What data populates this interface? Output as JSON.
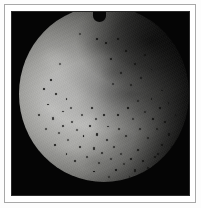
{
  "figure": {
    "kind": "endoscopic-photograph",
    "width_px": 201,
    "height_px": 208,
    "frame": {
      "page_background": "#fdfdfd",
      "rule_color": "#a8a8a8",
      "mat_color": "#ffffff",
      "panel_color": "#050505"
    },
    "image": {
      "modality": "endoscopy",
      "field_of_view": "circular",
      "illumination_center": "left-of-centre",
      "highlight_color": "#d2d2d0",
      "midtone_color": "#9a9a97",
      "shadow_color": "#1d1d1c",
      "background_color": "#050505",
      "features": [
        "bright mucosal surface filling lower-left two thirds",
        "dark shadowed fold sweeping from upper right toward centre",
        "numerous small dark petechial spots concentrated in lower half",
        "notch at top of circular field"
      ]
    },
    "spots": [
      {
        "x": 36.0,
        "y": 16.0,
        "r": 1.1
      },
      {
        "x": 46.0,
        "y": 18.5,
        "r": 1.0
      },
      {
        "x": 51.0,
        "y": 21.0,
        "r": 0.9
      },
      {
        "x": 58.5,
        "y": 19.0,
        "r": 1.0
      },
      {
        "x": 63.0,
        "y": 25.5,
        "r": 0.9
      },
      {
        "x": 54.0,
        "y": 30.0,
        "r": 0.8
      },
      {
        "x": 68.0,
        "y": 33.0,
        "r": 1.0
      },
      {
        "x": 74.0,
        "y": 28.0,
        "r": 0.9
      },
      {
        "x": 60.0,
        "y": 38.0,
        "r": 1.2
      },
      {
        "x": 72.0,
        "y": 41.0,
        "r": 1.0
      },
      {
        "x": 66.0,
        "y": 45.0,
        "r": 0.9
      },
      {
        "x": 78.0,
        "y": 36.0,
        "r": 0.8
      },
      {
        "x": 55.5,
        "y": 44.5,
        "r": 1.0
      },
      {
        "x": 24.0,
        "y": 33.0,
        "r": 0.9
      },
      {
        "x": 19.0,
        "y": 42.0,
        "r": 1.0
      },
      {
        "x": 14.5,
        "y": 47.0,
        "r": 0.9
      },
      {
        "x": 22.0,
        "y": 50.0,
        "r": 1.1
      },
      {
        "x": 17.0,
        "y": 56.0,
        "r": 0.9
      },
      {
        "x": 28.0,
        "y": 53.0,
        "r": 0.8
      },
      {
        "x": 12.0,
        "y": 62.0,
        "r": 1.0
      },
      {
        "x": 20.0,
        "y": 64.0,
        "r": 1.2
      },
      {
        "x": 26.0,
        "y": 60.0,
        "r": 0.9
      },
      {
        "x": 31.0,
        "y": 66.0,
        "r": 1.0
      },
      {
        "x": 16.0,
        "y": 70.0,
        "r": 1.1
      },
      {
        "x": 23.5,
        "y": 72.0,
        "r": 1.0
      },
      {
        "x": 34.0,
        "y": 70.5,
        "r": 1.2
      },
      {
        "x": 29.0,
        "y": 76.0,
        "r": 1.0
      },
      {
        "x": 38.0,
        "y": 74.0,
        "r": 0.9
      },
      {
        "x": 21.0,
        "y": 79.0,
        "r": 1.1
      },
      {
        "x": 42.0,
        "y": 68.0,
        "r": 1.0
      },
      {
        "x": 46.0,
        "y": 73.0,
        "r": 1.1
      },
      {
        "x": 36.0,
        "y": 80.0,
        "r": 1.0
      },
      {
        "x": 44.0,
        "y": 81.0,
        "r": 1.2
      },
      {
        "x": 52.0,
        "y": 76.0,
        "r": 1.0
      },
      {
        "x": 49.0,
        "y": 83.5,
        "r": 1.1
      },
      {
        "x": 56.0,
        "y": 80.0,
        "r": 1.0
      },
      {
        "x": 40.0,
        "y": 86.0,
        "r": 1.0
      },
      {
        "x": 47.0,
        "y": 89.0,
        "r": 1.1
      },
      {
        "x": 54.0,
        "y": 87.0,
        "r": 1.0
      },
      {
        "x": 60.0,
        "y": 84.0,
        "r": 1.1
      },
      {
        "x": 62.0,
        "y": 90.0,
        "r": 1.0
      },
      {
        "x": 57.0,
        "y": 93.0,
        "r": 0.9
      },
      {
        "x": 66.0,
        "y": 87.0,
        "r": 1.0
      },
      {
        "x": 70.0,
        "y": 82.0,
        "r": 1.1
      },
      {
        "x": 73.0,
        "y": 88.0,
        "r": 1.0
      },
      {
        "x": 68.0,
        "y": 93.5,
        "r": 1.1
      },
      {
        "x": 76.0,
        "y": 92.0,
        "r": 1.0
      },
      {
        "x": 80.0,
        "y": 86.0,
        "r": 0.9
      },
      {
        "x": 63.0,
        "y": 74.0,
        "r": 1.0
      },
      {
        "x": 71.0,
        "y": 70.0,
        "r": 0.9
      },
      {
        "x": 76.0,
        "y": 75.0,
        "r": 1.1
      },
      {
        "x": 81.0,
        "y": 70.0,
        "r": 1.0
      },
      {
        "x": 67.0,
        "y": 64.0,
        "r": 0.9
      },
      {
        "x": 74.0,
        "y": 60.0,
        "r": 1.0
      },
      {
        "x": 79.0,
        "y": 64.0,
        "r": 0.9
      },
      {
        "x": 83.0,
        "y": 58.0,
        "r": 1.0
      },
      {
        "x": 86.0,
        "y": 66.0,
        "r": 1.0
      },
      {
        "x": 88.0,
        "y": 73.0,
        "r": 1.1
      },
      {
        "x": 84.0,
        "y": 79.0,
        "r": 1.0
      },
      {
        "x": 90.0,
        "y": 80.0,
        "r": 0.9
      },
      {
        "x": 82.0,
        "y": 84.0,
        "r": 1.0
      },
      {
        "x": 87.0,
        "y": 88.0,
        "r": 1.0
      },
      {
        "x": 78.0,
        "y": 53.0,
        "r": 0.9
      },
      {
        "x": 84.0,
        "y": 48.0,
        "r": 0.8
      },
      {
        "x": 88.0,
        "y": 55.0,
        "r": 0.9
      },
      {
        "x": 92.0,
        "y": 62.0,
        "r": 0.9
      },
      {
        "x": 70.0,
        "y": 54.0,
        "r": 0.9
      },
      {
        "x": 64.0,
        "y": 58.0,
        "r": 0.9
      },
      {
        "x": 58.0,
        "y": 62.0,
        "r": 1.0
      },
      {
        "x": 50.0,
        "y": 62.0,
        "r": 0.9
      },
      {
        "x": 43.0,
        "y": 58.0,
        "r": 0.9
      },
      {
        "x": 33.0,
        "y": 88.0,
        "r": 1.0
      },
      {
        "x": 28.0,
        "y": 84.0,
        "r": 0.9
      },
      {
        "x": 26.0,
        "y": 68.0,
        "r": 0.9
      },
      {
        "x": 52.5,
        "y": 68.5,
        "r": 0.9
      },
      {
        "x": 59.0,
        "y": 70.0,
        "r": 0.9
      },
      {
        "x": 45.5,
        "y": 64.0,
        "r": 0.9
      },
      {
        "x": 37.0,
        "y": 62.0,
        "r": 0.9
      },
      {
        "x": 30.5,
        "y": 58.0,
        "r": 0.8
      },
      {
        "x": 65.0,
        "y": 97.0,
        "r": 0.9
      },
      {
        "x": 53.0,
        "y": 97.0,
        "r": 0.9
      },
      {
        "x": 44.0,
        "y": 94.0,
        "r": 0.9
      },
      {
        "x": 72.0,
        "y": 97.0,
        "r": 0.9
      },
      {
        "x": 79.0,
        "y": 96.0,
        "r": 0.9
      }
    ]
  }
}
